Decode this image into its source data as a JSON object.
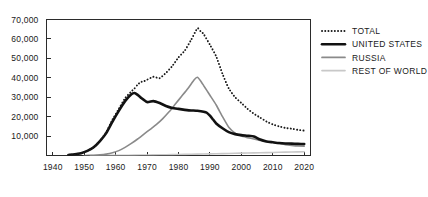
{
  "chart_data": {
    "type": "line",
    "title": "",
    "subtitle": "",
    "xlabel": "",
    "ylabel": "",
    "xlim": [
      1938,
      2022
    ],
    "ylim": [
      0,
      70000
    ],
    "grid": false,
    "legend_position": "right",
    "x_ticks": [
      "1940",
      "1950",
      "1960",
      "1970",
      "1980",
      "1990",
      "2000",
      "2010",
      "2020"
    ],
    "x_tick_values": [
      1940,
      1950,
      1960,
      1970,
      1980,
      1990,
      2000,
      2010,
      2020
    ],
    "y_ticks": [
      "10,000",
      "20,000",
      "30,000",
      "40,000",
      "50,000",
      "60,000",
      "70,000"
    ],
    "y_tick_values": [
      10000,
      20000,
      30000,
      40000,
      50000,
      60000,
      70000
    ],
    "series": [
      {
        "name": "TOTAL",
        "color": "#1a1a1a",
        "style": "dotted",
        "width": 1.9,
        "x": [
          1945,
          1947,
          1949,
          1951,
          1953,
          1955,
          1957,
          1959,
          1961,
          1963,
          1965,
          1966,
          1967,
          1968,
          1969,
          1970,
          1972,
          1974,
          1976,
          1978,
          1980,
          1982,
          1984,
          1986,
          1987,
          1988,
          1990,
          1992,
          1994,
          1996,
          1998,
          2000,
          2002,
          2004,
          2006,
          2008,
          2010,
          2012,
          2014,
          2016,
          2018,
          2020
        ],
        "y": [
          300,
          600,
          1200,
          2400,
          4200,
          7500,
          12000,
          18500,
          24000,
          29500,
          33000,
          34500,
          36500,
          37800,
          38200,
          39000,
          40500,
          39800,
          42500,
          46000,
          50500,
          54000,
          59500,
          65500,
          64000,
          62500,
          57000,
          51000,
          42000,
          34500,
          30000,
          27000,
          24000,
          21500,
          19500,
          17500,
          16000,
          15000,
          14200,
          13800,
          13200,
          12800
        ]
      },
      {
        "name": "UNITED STATES",
        "color": "#111111",
        "style": "solid",
        "width": 2.6,
        "x": [
          1945,
          1947,
          1949,
          1951,
          1953,
          1955,
          1957,
          1959,
          1961,
          1963,
          1965,
          1966,
          1967,
          1968,
          1970,
          1972,
          1974,
          1976,
          1978,
          1980,
          1982,
          1984,
          1986,
          1988,
          1989,
          1990,
          1991,
          1992,
          1994,
          1996,
          1998,
          2000,
          2002,
          2004,
          2006,
          2008,
          2010,
          2012,
          2014,
          2016,
          2018,
          2020
        ],
        "y": [
          300,
          600,
          1200,
          2400,
          4200,
          7400,
          11500,
          17500,
          23000,
          28000,
          31500,
          32200,
          31200,
          29800,
          27500,
          28000,
          27000,
          25500,
          24500,
          24000,
          23500,
          23200,
          23000,
          22500,
          22000,
          20500,
          18500,
          16500,
          14000,
          12000,
          11000,
          10500,
          10200,
          9800,
          8200,
          7200,
          6800,
          6400,
          6200,
          6100,
          6000,
          5900
        ]
      },
      {
        "name": "RUSSIA",
        "color": "#8a8a8a",
        "style": "solid",
        "width": 1.6,
        "x": [
          1950,
          1953,
          1955,
          1957,
          1959,
          1961,
          1963,
          1965,
          1967,
          1969,
          1971,
          1973,
          1975,
          1977,
          1979,
          1981,
          1983,
          1985,
          1986,
          1987,
          1988,
          1989,
          1990,
          1992,
          1994,
          1996,
          1998,
          2000,
          2002,
          2004,
          2006,
          2008,
          2010,
          2012,
          2014,
          2016,
          2018,
          2020
        ],
        "y": [
          0,
          100,
          300,
          700,
          1400,
          2500,
          4200,
          6200,
          8500,
          11000,
          13500,
          16000,
          19000,
          22500,
          26500,
          30500,
          34500,
          39000,
          40300,
          38500,
          36000,
          33500,
          31000,
          26000,
          20000,
          14500,
          11500,
          10000,
          9200,
          8500,
          7800,
          7200,
          6800,
          6200,
          5600,
          5200,
          4900,
          4800
        ]
      },
      {
        "name": "REST OF WORLD",
        "color": "#c8c8c8",
        "style": "solid",
        "width": 1.6,
        "x": [
          1952,
          1956,
          1960,
          1964,
          1968,
          1972,
          1976,
          1980,
          1984,
          1988,
          1992,
          1996,
          2000,
          2004,
          2008,
          2012,
          2016,
          2020
        ],
        "y": [
          0,
          30,
          80,
          140,
          220,
          300,
          400,
          500,
          620,
          750,
          900,
          1050,
          1200,
          1350,
          1500,
          1650,
          1800,
          1950
        ]
      }
    ]
  },
  "legend": {
    "items": [
      {
        "label": "TOTAL",
        "swatch": "dotted-line-swatch"
      },
      {
        "label": "UNITED STATES",
        "swatch": "thick-line-swatch"
      },
      {
        "label": "RUSSIA",
        "swatch": "medium-line-swatch"
      },
      {
        "label": "REST OF WORLD",
        "swatch": "light-line-swatch"
      }
    ]
  },
  "axes": {
    "y_labels": [
      "70,000",
      "60,000",
      "50,000",
      "40,000",
      "30,000",
      "20,000",
      "10,000"
    ],
    "x_labels": [
      "1940",
      "1950",
      "1960",
      "1970",
      "1980",
      "1990",
      "2000",
      "2010",
      "2020"
    ]
  },
  "colors": {
    "total": "#1a1a1a",
    "united_states": "#111111",
    "russia": "#8a8a8a",
    "rest_of_world": "#c8c8c8",
    "axis": "#2b2b2b",
    "background": "#ffffff"
  }
}
